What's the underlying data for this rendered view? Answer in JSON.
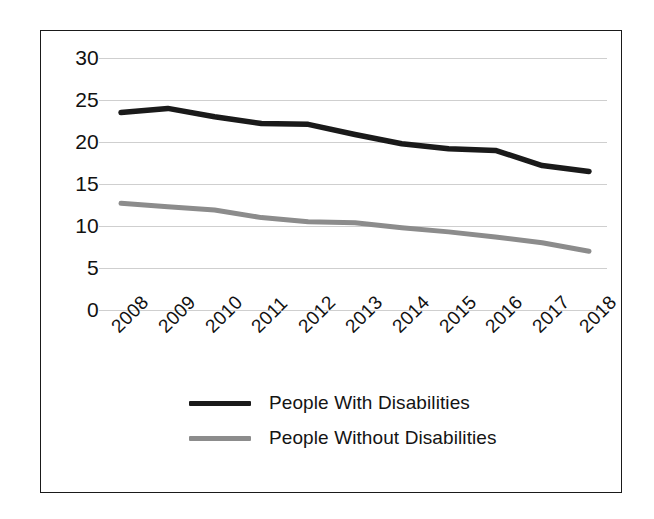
{
  "chart_data": {
    "type": "line",
    "title": "",
    "subtitle": "",
    "xlabel": "",
    "ylabel": "",
    "categories": [
      "2008",
      "2009",
      "2010",
      "2011",
      "2012",
      "2013",
      "2014",
      "2015",
      "2016",
      "2017",
      "2018"
    ],
    "ylim": [
      0,
      30
    ],
    "yticks": [
      0,
      5,
      10,
      15,
      20,
      25,
      30
    ],
    "ytick_labels": [
      "0",
      "5",
      "10",
      "15",
      "20",
      "25",
      "30"
    ],
    "grid": true,
    "legend_position": "bottom",
    "xtick_rotation": -45,
    "series": [
      {
        "name": "People With Disabilities",
        "color": "#1a1a1a",
        "values": [
          23.5,
          24.0,
          23.0,
          22.2,
          22.1,
          20.9,
          19.8,
          19.2,
          19.0,
          17.2,
          16.5
        ]
      },
      {
        "name": "People Without Disabilities",
        "color": "#8c8c8c",
        "values": [
          12.7,
          12.3,
          11.9,
          11.0,
          10.5,
          10.4,
          9.8,
          9.3,
          8.7,
          8.0,
          7.0
        ]
      }
    ]
  },
  "frame": {
    "border_color": "#1a1a1a",
    "background": "#ffffff",
    "gridline_color": "#cfcfcf"
  }
}
